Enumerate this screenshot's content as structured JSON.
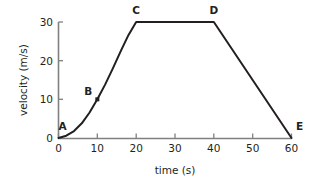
{
  "chart_data": {
    "type": "line",
    "title": "",
    "subtitle": "",
    "xlabel": "time (s)",
    "ylabel": "velocity (m/s)",
    "xlim": [
      0,
      60
    ],
    "ylim": [
      0,
      30
    ],
    "xticks": [
      0,
      10,
      20,
      30,
      40,
      50,
      60
    ],
    "yticks": [
      0,
      10,
      20,
      30
    ],
    "xtick_labels": [
      "0",
      "10",
      "20",
      "30",
      "40",
      "50",
      "60"
    ],
    "ytick_labels": [
      "0",
      "10",
      "20",
      "30"
    ],
    "grid": false,
    "legend": false,
    "series": [
      {
        "name": "velocity",
        "x": [
          0,
          2,
          4,
          6,
          8,
          10,
          12,
          14,
          16,
          18,
          20,
          40,
          60
        ],
        "y": [
          0,
          0.6,
          1.8,
          3.8,
          6.6,
          10.0,
          13.8,
          18.0,
          22.4,
          26.6,
          30.0,
          30.0,
          0.0
        ],
        "color": "#231f20"
      }
    ],
    "annotations": [
      {
        "label": "A",
        "x": 0,
        "y": 0,
        "label_dx": 4,
        "label_dy": -8,
        "marker": false
      },
      {
        "label": "B",
        "x": 10,
        "y": 10,
        "label_dx": -9,
        "label_dy": -4,
        "marker": true
      },
      {
        "label": "C",
        "x": 20,
        "y": 30,
        "label_dx": 0,
        "label_dy": -8,
        "marker": false
      },
      {
        "label": "D",
        "x": 40,
        "y": 30,
        "label_dx": 0,
        "label_dy": -8,
        "marker": false
      },
      {
        "label": "E",
        "x": 60,
        "y": 0,
        "label_dx": 8,
        "label_dy": -8,
        "marker": false
      }
    ],
    "colors": {
      "axis": "#808080",
      "curve": "#231f20",
      "text": "#231f20",
      "background": "#ffffff"
    }
  },
  "axis_labels": {
    "x_title": "time (s)",
    "y_title": "velocity (m/s)"
  }
}
